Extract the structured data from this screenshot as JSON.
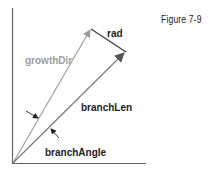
{
  "figure": {
    "caption": "Figure 7-9"
  },
  "labels": {
    "rad": "rad",
    "growthDir": "growthDir",
    "branchLen": "branchLen",
    "branchAngle": "branchAngle"
  },
  "colors": {
    "axis": "#555555",
    "growthDir": "#9a9a9a",
    "branchLen": "#6a6a6a",
    "rad": "#444444",
    "text_dark": "#222222",
    "text_gray": "#a0a0a0"
  }
}
